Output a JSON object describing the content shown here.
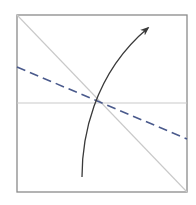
{
  "diagram": {
    "title": "Origami fold diagram",
    "colors": {
      "background": "#ffffff",
      "paper_border": "#8a8a8a",
      "crease": "#c9c9c9",
      "fold_line": "#4a5a8c",
      "arrow": "#3a3a3a"
    },
    "paper": {
      "x": 17,
      "y": 15,
      "width": 170,
      "height": 177
    },
    "creases": [
      {
        "name": "diagonal-crease",
        "x1": 17,
        "y1": 15,
        "x2": 187,
        "y2": 192
      },
      {
        "name": "horizontal-crease",
        "x1": 17,
        "y1": 103,
        "x2": 187,
        "y2": 103
      }
    ],
    "fold_line": {
      "name": "valley-fold-line",
      "x1": 17,
      "y1": 67,
      "x2": 187,
      "y2": 139,
      "dash": "9,5"
    },
    "arrow": {
      "name": "fold-direction-arrow",
      "path": "M 82 177 C 82 140, 92 75, 148 28",
      "tip": {
        "x": 150,
        "y": 26
      }
    },
    "intersection": {
      "x": 100,
      "y": 103
    }
  }
}
